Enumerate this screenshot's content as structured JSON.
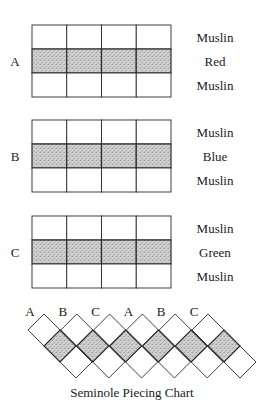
{
  "caption": "Seminole Piecing Chart",
  "colors": {
    "line": "#2a2a2a",
    "fabric_plain": "#ffffff",
    "fabric_colored": "#c9c9c9"
  },
  "strips": [
    {
      "id": "A",
      "columns": 4,
      "rows": [
        {
          "fabric": "Muslin",
          "shaded": false
        },
        {
          "fabric": "Red",
          "shaded": true
        },
        {
          "fabric": "Muslin",
          "shaded": false
        }
      ]
    },
    {
      "id": "B",
      "columns": 4,
      "rows": [
        {
          "fabric": "Muslin",
          "shaded": false
        },
        {
          "fabric": "Blue",
          "shaded": true
        },
        {
          "fabric": "Muslin",
          "shaded": false
        }
      ]
    },
    {
      "id": "C",
      "columns": 4,
      "rows": [
        {
          "fabric": "Muslin",
          "shaded": false
        },
        {
          "fabric": "Green",
          "shaded": true
        },
        {
          "fabric": "Muslin",
          "shaded": false
        }
      ]
    }
  ],
  "assembled_sequence": [
    "A",
    "B",
    "C",
    "A",
    "B",
    "C"
  ]
}
